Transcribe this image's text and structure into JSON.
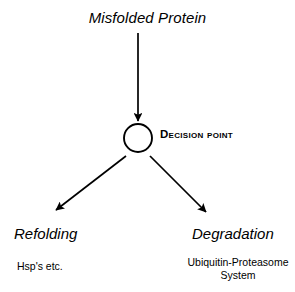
{
  "diagram": {
    "background_color": "#ffffff",
    "stroke_color": "#000000",
    "title": "Misfolded Protein",
    "decision_node": {
      "label": "Decision point",
      "shape": "circle",
      "fill": "none",
      "center_x": 138,
      "center_y": 138,
      "radius": 14
    },
    "branches": {
      "left": {
        "label": "Refolding",
        "caption": "Hsp's etc."
      },
      "right": {
        "label": "Degradation",
        "caption": "Ubiquitin-Proteasome System",
        "caption_line1": "Ubiquitin-",
        "caption_line2": "Proteasome System"
      }
    },
    "arrows": [
      {
        "name": "misfolded-to-decision",
        "from_x": 138,
        "from_y": 33,
        "to_x": 138,
        "to_y": 121
      },
      {
        "name": "decision-to-refolding",
        "from_x": 126,
        "from_y": 156,
        "to_x": 55,
        "to_y": 211
      },
      {
        "name": "decision-to-degradation",
        "from_x": 150,
        "from_y": 156,
        "to_x": 207,
        "to_y": 213
      }
    ]
  }
}
